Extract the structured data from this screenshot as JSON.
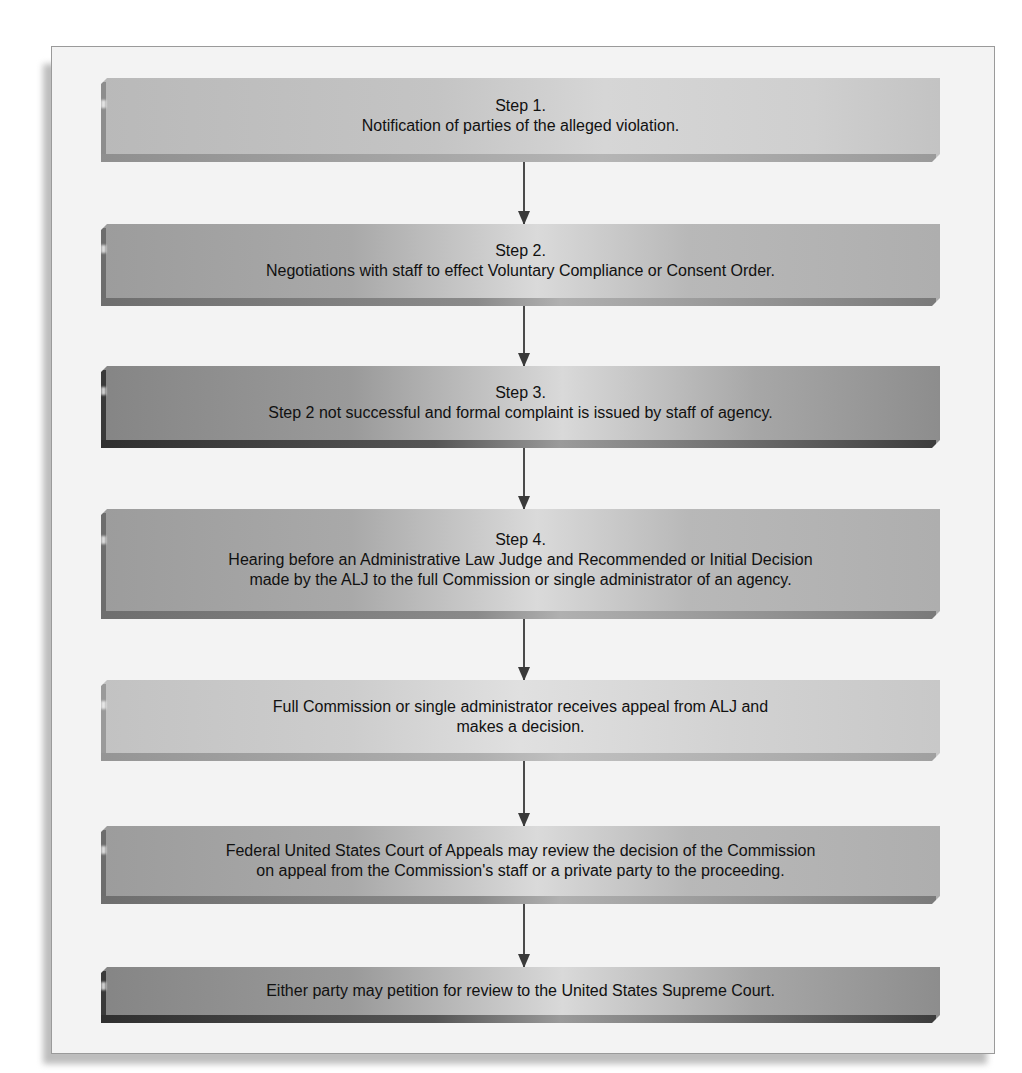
{
  "diagram": {
    "type": "flowchart",
    "direction": "top-to-bottom",
    "steps": [
      {
        "id": 1,
        "title": "Step 1.",
        "lines": [
          "Notification of parties of the alleged violation."
        ]
      },
      {
        "id": 2,
        "title": "Step 2.",
        "lines": [
          "Negotiations with staff to effect Voluntary Compliance or Consent Order."
        ]
      },
      {
        "id": 3,
        "title": "Step 3.",
        "lines": [
          "Step 2 not successful and formal complaint is issued by  staff of agency."
        ]
      },
      {
        "id": 4,
        "title": "Step 4.",
        "lines": [
          "Hearing before an Administrative Law Judge and Recommended or Initial Decision",
          "made by the ALJ to the full Commission or single administrator of an agency."
        ]
      },
      {
        "id": 5,
        "title": "",
        "lines": [
          "Full Commission or single administrator receives appeal from ALJ and",
          "makes a decision."
        ]
      },
      {
        "id": 6,
        "title": "",
        "lines": [
          "Federal United States Court of Appeals may review the decision of the Commission",
          "on appeal from the Commission's staff or a private party to the proceeding."
        ]
      },
      {
        "id": 7,
        "title": "",
        "lines": [
          "Either party may petition for review to the United States Supreme Court."
        ]
      }
    ],
    "connectors": [
      {
        "from": 1,
        "to": 2,
        "icon": "arrow-down-icon"
      },
      {
        "from": 2,
        "to": 3,
        "icon": "arrow-down-icon"
      },
      {
        "from": 3,
        "to": 4,
        "icon": "arrow-down-icon"
      },
      {
        "from": 4,
        "to": 5,
        "icon": "arrow-down-icon"
      },
      {
        "from": 5,
        "to": 6,
        "icon": "arrow-down-icon"
      },
      {
        "from": 6,
        "to": 7,
        "icon": "arrow-down-icon"
      }
    ],
    "colors": {
      "frame_bg": "#f3f3f3",
      "frame_border": "#9a9a9a",
      "arrow": "#4a4a4a",
      "text": "#111111"
    }
  }
}
